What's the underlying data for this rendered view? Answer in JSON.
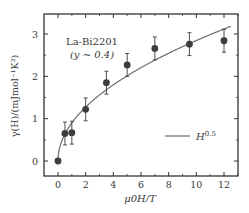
{
  "chart_data": {
    "type": "scatter",
    "title": "",
    "annotation_line1": "La-Bi2201",
    "annotation_line2": "(y ~ 0.4)",
    "xlabel": "μ0H/T",
    "ylabel": "γ(H)/(mJmol⁻¹K²)",
    "xlim": [
      -1,
      13
    ],
    "ylim": [
      -0.4,
      3.5
    ],
    "xticks": [
      0,
      2,
      4,
      6,
      8,
      10,
      12
    ],
    "yticks": [
      0,
      1,
      2,
      3
    ],
    "grid": false,
    "legend_position": "lower right",
    "series": [
      {
        "name": "data",
        "kind": "points-with-errorbars",
        "x": [
          0,
          0.5,
          1.0,
          2.0,
          3.5,
          5.0,
          7.0,
          9.5,
          12.0
        ],
        "y": [
          0,
          0.65,
          0.67,
          1.22,
          1.85,
          2.27,
          2.66,
          2.76,
          2.84
        ],
        "yerr": [
          0,
          0.27,
          0.27,
          0.27,
          0.27,
          0.27,
          0.27,
          0.27,
          0.27
        ]
      },
      {
        "name": "H^0.5",
        "kind": "line",
        "formula": "0.9 * x^0.5",
        "x_range": [
          0,
          12.5
        ]
      }
    ],
    "legend": [
      {
        "label": "H",
        "sup": "0.5"
      }
    ],
    "colors": {
      "points": "#3c3c3c",
      "line": "#6e6e6e",
      "axes": "#333333",
      "text": "#3a3a3a"
    }
  }
}
